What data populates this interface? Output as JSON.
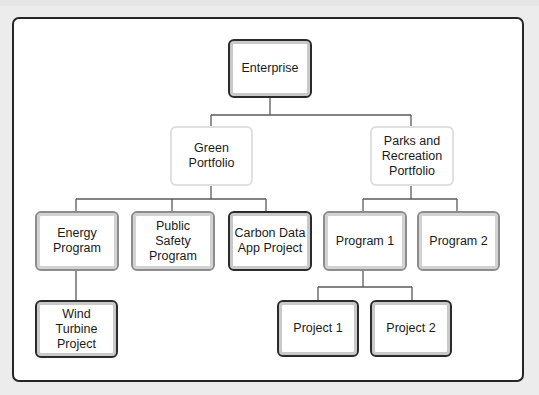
{
  "diagram": {
    "type": "org-chart",
    "colors": {
      "page_background": "#ececec",
      "frame_background": "#ffffff",
      "frame_border": "#262626",
      "connector": "#5a5a5a",
      "dark_border": "#2b2b2b",
      "medium_border": "#8c8c8c",
      "light_border": "#e0e0e0"
    },
    "nodes": {
      "enterprise": {
        "label": "Enterprise",
        "level": 0,
        "style": "dark"
      },
      "green_portfolio": {
        "label": "Green\nPortfolio",
        "level": 1,
        "style": "light",
        "parent": "enterprise"
      },
      "parks_portfolio": {
        "label": "Parks and\nRecreation\nPortfolio",
        "level": 1,
        "style": "light",
        "parent": "enterprise"
      },
      "energy_program": {
        "label": "Energy\nProgram",
        "level": 2,
        "style": "medium",
        "parent": "green_portfolio"
      },
      "public_safety_program": {
        "label": "Public\nSafety\nProgram",
        "level": 2,
        "style": "medium",
        "parent": "green_portfolio"
      },
      "carbon_data_project": {
        "label": "Carbon Data\nApp Project",
        "level": 2,
        "style": "dark",
        "parent": "green_portfolio"
      },
      "program_1": {
        "label": "Program 1",
        "level": 2,
        "style": "medium",
        "parent": "parks_portfolio"
      },
      "program_2": {
        "label": "Program 2",
        "level": 2,
        "style": "medium",
        "parent": "parks_portfolio"
      },
      "wind_turbine_project": {
        "label": "Wind\nTurbine\nProject",
        "level": 3,
        "style": "dark",
        "parent": "energy_program"
      },
      "project_1": {
        "label": "Project 1",
        "level": 3,
        "style": "dark",
        "parent": "program_1"
      },
      "project_2": {
        "label": "Project 2",
        "level": 3,
        "style": "dark",
        "parent": "program_1"
      }
    }
  }
}
